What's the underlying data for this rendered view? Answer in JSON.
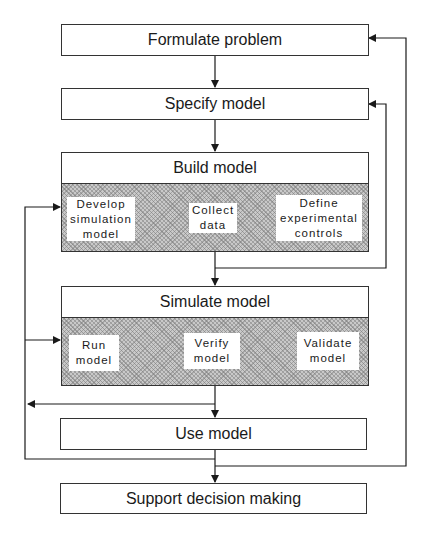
{
  "diagram": {
    "steps": {
      "formulate": "Formulate problem",
      "specify": "Specify model",
      "build": {
        "title": "Build model",
        "activities": [
          "Develop\nsimulation\nmodel",
          "Collect\ndata",
          "Define\nexperimental\ncontrols"
        ]
      },
      "simulate": {
        "title": "Simulate model",
        "activities": [
          "Run\nmodel",
          "Verify\nmodel",
          "Validate\nmodel"
        ]
      },
      "use": "Use model",
      "support": "Support decision making"
    },
    "colors": {
      "line": "#1a1a1a",
      "hatch": "#c9c9c9",
      "box_fill": "#ffffff"
    }
  }
}
